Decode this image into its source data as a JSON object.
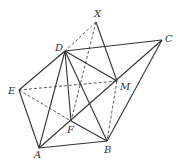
{
  "diagram": {
    "type": "geometry-figure",
    "points": {
      "X": {
        "x": 96,
        "y": 22,
        "label": "X",
        "lx": 94,
        "ly": 17
      },
      "D": {
        "x": 65,
        "y": 51,
        "label": "D",
        "lx": 55,
        "ly": 51
      },
      "C": {
        "x": 162,
        "y": 40,
        "label": "C",
        "lx": 165,
        "ly": 42
      },
      "E": {
        "x": 19,
        "y": 90,
        "label": "E",
        "lx": 8,
        "ly": 94
      },
      "M": {
        "x": 117,
        "y": 81,
        "label": "M",
        "lx": 120,
        "ly": 90
      },
      "F": {
        "x": 71,
        "y": 121,
        "label": "F",
        "lx": 67,
        "ly": 133
      },
      "A": {
        "x": 39,
        "y": 148,
        "label": "A",
        "lx": 34,
        "ly": 158
      },
      "B": {
        "x": 107,
        "y": 141,
        "label": "B",
        "lx": 104,
        "ly": 153
      }
    },
    "solid_edges": [
      [
        "D",
        "C"
      ],
      [
        "C",
        "B"
      ],
      [
        "B",
        "A"
      ],
      [
        "A",
        "E"
      ],
      [
        "E",
        "D"
      ],
      [
        "D",
        "A"
      ],
      [
        "D",
        "F"
      ],
      [
        "D",
        "B"
      ],
      [
        "D",
        "M"
      ],
      [
        "X",
        "M"
      ],
      [
        "A",
        "C"
      ],
      [
        "F",
        "B"
      ]
    ],
    "dashed_edges": [
      [
        "X",
        "D"
      ],
      [
        "X",
        "F"
      ],
      [
        "E",
        "M"
      ],
      [
        "E",
        "F"
      ],
      [
        "M",
        "B"
      ]
    ],
    "colors": {
      "line": "#333333",
      "background": "#ffffff"
    }
  }
}
